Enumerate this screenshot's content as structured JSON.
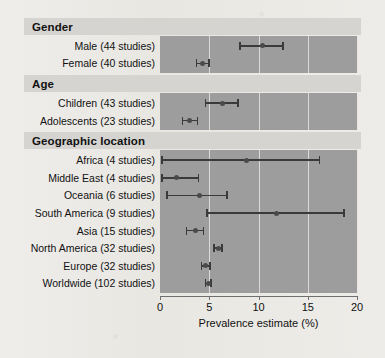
{
  "chart_data": {
    "type": "scatter",
    "title": "",
    "xlabel": "Prevalence estimate (%)",
    "ylabel": "",
    "xlim": [
      0,
      20
    ],
    "xticks": [
      0,
      5,
      10,
      15,
      20
    ],
    "xticklabels": [
      "0",
      "5",
      "10",
      "15",
      "20"
    ],
    "grid": true,
    "legend": false,
    "point_estimate_label": "Prevalence estimate (%)",
    "groups": [
      {
        "name": "Gender",
        "rows": [
          {
            "label": "Male (44 studies)",
            "estimate": 10.4,
            "low": 8.1,
            "high": 12.5
          },
          {
            "label": "Female (40 studies)",
            "estimate": 4.3,
            "low": 3.7,
            "high": 5.0
          }
        ]
      },
      {
        "name": "Age",
        "rows": [
          {
            "label": "Children (43 studies)",
            "estimate": 6.3,
            "low": 4.6,
            "high": 7.9
          },
          {
            "label": "Adolescents (23 studies)",
            "estimate": 3.0,
            "low": 2.3,
            "high": 3.8
          }
        ]
      },
      {
        "name": "Geographic location",
        "rows": [
          {
            "label": "Africa (4 studies)",
            "estimate": 8.8,
            "low": 0.2,
            "high": 16.2
          },
          {
            "label": "Middle East (4 studies)",
            "estimate": 1.7,
            "low": 0.2,
            "high": 3.9
          },
          {
            "label": "Oceania (6 studies)",
            "estimate": 4.0,
            "low": 0.7,
            "high": 6.8
          },
          {
            "label": "South America (9 studies)",
            "estimate": 11.8,
            "low": 4.8,
            "high": 18.7
          },
          {
            "label": "Asia (15 studies)",
            "estimate": 3.6,
            "low": 2.7,
            "high": 4.4
          },
          {
            "label": "North America (32 studies)",
            "estimate": 5.9,
            "low": 5.5,
            "high": 6.3
          },
          {
            "label": "Europe (32 studies)",
            "estimate": 4.6,
            "low": 4.2,
            "high": 5.1
          },
          {
            "label": "Worldwide (102 studies)",
            "estimate": 4.9,
            "low": 4.6,
            "high": 5.2
          }
        ]
      }
    ],
    "colors": {
      "panel_background": "#9d9d9d",
      "band_background": "#d6d4d0",
      "marker": "#4a4a4a",
      "whisker": "#3a3a3a",
      "gridline": "#e6e4e0",
      "text": "#111111",
      "page_background": "#eceae5"
    }
  }
}
